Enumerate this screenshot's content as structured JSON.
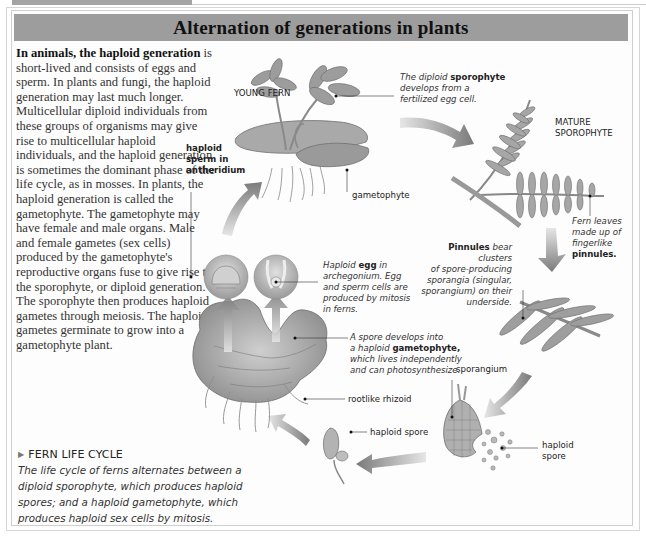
{
  "title": "Alternation of generations in plants",
  "intro": {
    "lead_bold": "In animals, the haploid generation",
    "text": " is short-lived and consists of eggs and sperm. In plants and fungi, the haploid generation may last much longer. Multicellular diploid individuals from these groups of organisms may give rise to multicellular haploid individuals, and the haploid generation is sometimes the dominant phase of the life cycle, as in mosses. In plants, the haploid generation is called the gametophyte. The gametophyte may have female and male organs. Male and female gametes (sex cells) produced by the gametophyte's reproductive organs fuse to give rise to the sporophyte, or diploid generation. The sporophyte then produces haploid gametes through meiosis. The haploid gametes germinate to grow into a gametophyte plant."
  },
  "caption": {
    "heading": "FERN LIFE CYCLE",
    "marker": "▶",
    "body": "The life cycle of ferns alternates between a diploid sporophyte, which produces haploid spores; and a haploid gametophyte, which produces haploid sex cells by mitosis."
  },
  "labels": {
    "young_fern": "YOUNG FERN",
    "sporophyte_note": {
      "pre": "The diploid ",
      "bold": "sporophyte",
      "post1": "develops from a",
      "post2": "fertilized egg cell."
    },
    "mature_sporophyte": [
      "MATURE",
      "SPOROPHYTE"
    ],
    "gametophyte": "gametophyte",
    "haploid_sperm": [
      "haploid",
      "sperm in",
      "antheridium"
    ],
    "fern_leaves": {
      "l1": "Fern leaves",
      "l2": "made up of",
      "l3": "fingerlike",
      "bold": "pinnules."
    },
    "pinnules": {
      "bold": "Pinnules",
      "l1": " bear clusters",
      "l2": "of spore-producing",
      "l3": "sporangia (singular,",
      "l4": "sporangium) on their",
      "l5": "underside."
    },
    "haploid_egg": {
      "pre": "Haploid ",
      "bold": "egg",
      "post": " in",
      "l2": "archegonium. Egg",
      "l3": "and sperm cells are",
      "l4": "produced by mitosis",
      "l5": "in ferns."
    },
    "spore_develops": {
      "l1": "A spore develops into",
      "pre": "a haploid ",
      "bold": "gametophyte,",
      "l3": "which lives independently",
      "l4": "and can photosynthesize."
    },
    "sporangium": "sporangium",
    "rootlike_rhizoid": "rootlike rhizoid",
    "haploid_spore_left": "haploid spore",
    "haploid_spore_right": [
      "haploid",
      "spore"
    ]
  },
  "colors": {
    "title_bar": "#9d9d9d",
    "arrow": "#7a7a7a",
    "plant": "#a8a8a8",
    "plant_dark": "#6e6e6e"
  }
}
